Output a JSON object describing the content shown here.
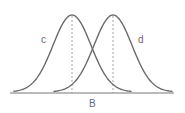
{
  "diagram": {
    "type": "two overlapping normal distribution curves",
    "axis_label": "B",
    "curves": [
      {
        "label": "c",
        "mean_x": 72,
        "peak_y": 15,
        "start_x": 14,
        "end_x": 131
      },
      {
        "label": "d",
        "mean_x": 113,
        "peak_y": 15,
        "start_x": 54,
        "end_x": 172
      }
    ],
    "mean_markers": "dashed vertical lines from each curve peak to the axis",
    "colors": {
      "curve": "#6a6a6a",
      "guide": "#9a9a9a",
      "axis": "#777777",
      "background": "#ffffff"
    }
  }
}
